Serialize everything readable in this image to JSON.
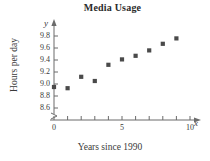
{
  "chart_data": {
    "type": "scatter",
    "title": "Media Usage",
    "xlabel": "Years since 1990",
    "ylabel": "Hours per day",
    "x_axis_variable": "x",
    "y_axis_variable": "y",
    "xlim": [
      0,
      10.6
    ],
    "ylim": [
      8.5,
      9.9
    ],
    "grid": false,
    "legend": null,
    "axis_break_y": true,
    "x_ticks": [
      0,
      1,
      2,
      3,
      4,
      5,
      6,
      7,
      8,
      9,
      10
    ],
    "x_tick_labels": [
      "0",
      "",
      "",
      "",
      "",
      "5",
      "",
      "",
      "",
      "",
      "10"
    ],
    "y_ticks": [
      8.6,
      8.8,
      9.0,
      9.2,
      9.4,
      9.6,
      9.8
    ],
    "y_tick_labels": [
      "8.6",
      "8.8",
      "9.0",
      "9.2",
      "9.4",
      "9.6",
      "9.8"
    ],
    "x": [
      0,
      1,
      2,
      3,
      4,
      5,
      6,
      7,
      8,
      9
    ],
    "values": [
      8.95,
      8.93,
      9.12,
      9.05,
      9.32,
      9.41,
      9.47,
      9.56,
      9.67,
      9.76
    ],
    "marker": "square",
    "marker_color": "#4a4a4a"
  },
  "colors": {
    "axis": "#6b6b6b",
    "marker": "#4a4a4a",
    "text": "#3a3a3a",
    "title": "#2b2b2b",
    "background": "#ffffff"
  }
}
